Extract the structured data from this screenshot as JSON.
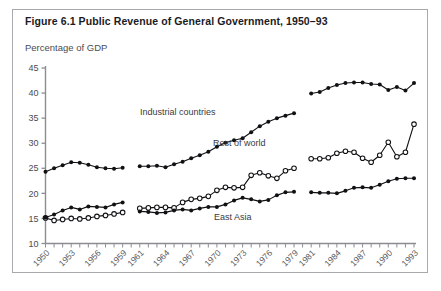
{
  "figure": {
    "title": "Figure 6.1 Public Revenue of General Government, 1950–93",
    "subtitle": "Percentage of GDP"
  },
  "annotations": {
    "industrial": "Industrial countries",
    "rest_of_world": "Rest of world",
    "east_asia": "East Asia"
  },
  "chart_data": {
    "type": "line",
    "title": "Figure 6.1 Public Revenue of General Government, 1950–93",
    "subtitle": "Percentage of GDP",
    "xlabel": "",
    "ylabel": "Percentage of GDP",
    "ylim": [
      10,
      45
    ],
    "ytick_values": [
      10,
      15,
      20,
      25,
      30,
      35,
      40,
      45
    ],
    "xlim": [
      1950,
      1993
    ],
    "xtick_labels": [
      "1950",
      "1953",
      "1956",
      "1959",
      "1961",
      "1964",
      "1967",
      "1970",
      "1973",
      "1976",
      "1979",
      "1981",
      "1984",
      "1987",
      "1990",
      "1993"
    ],
    "xtick_label_years": [
      1950,
      1953,
      1956,
      1959,
      1961,
      1964,
      1967,
      1970,
      1973,
      1976,
      1979,
      1981,
      1984,
      1987,
      1990,
      1993
    ],
    "minor_ticks_every_year": true,
    "grid": false,
    "legend_position": "inline-annotations",
    "data_gap_years": [
      1960,
      1980
    ],
    "series": [
      {
        "name": "Industrial countries",
        "marker": "filled-circle",
        "x": [
          1950,
          1951,
          1952,
          1953,
          1954,
          1955,
          1956,
          1957,
          1958,
          1959,
          1961,
          1962,
          1963,
          1964,
          1965,
          1966,
          1967,
          1968,
          1969,
          1970,
          1971,
          1972,
          1973,
          1974,
          1975,
          1976,
          1977,
          1978,
          1979,
          1981,
          1982,
          1983,
          1984,
          1985,
          1986,
          1987,
          1988,
          1989,
          1990,
          1991,
          1992,
          1993
        ],
        "values": [
          24.3,
          25.0,
          25.6,
          26.2,
          26.1,
          25.7,
          25.2,
          25.0,
          24.9,
          25.1,
          25.4,
          25.4,
          25.5,
          25.2,
          25.8,
          26.3,
          27.0,
          27.6,
          28.3,
          29.3,
          30.1,
          30.6,
          31.0,
          32.2,
          33.4,
          34.3,
          35.0,
          35.5,
          36.0,
          39.9,
          40.2,
          41.0,
          41.6,
          42.0,
          42.1,
          42.1,
          41.8,
          41.7,
          40.6,
          41.2,
          40.5,
          42.0
        ]
      },
      {
        "name": "Rest of world",
        "marker": "open-circle",
        "x": [
          1950,
          1951,
          1952,
          1953,
          1954,
          1955,
          1956,
          1957,
          1958,
          1959,
          1961,
          1962,
          1963,
          1964,
          1965,
          1966,
          1967,
          1968,
          1969,
          1970,
          1971,
          1972,
          1973,
          1974,
          1975,
          1976,
          1977,
          1978,
          1979,
          1981,
          1982,
          1983,
          1984,
          1985,
          1986,
          1987,
          1988,
          1989,
          1990,
          1991,
          1992,
          1993
        ],
        "values": [
          15.1,
          14.6,
          14.8,
          15.0,
          14.9,
          15.1,
          15.4,
          15.6,
          15.9,
          16.2,
          17.0,
          17.1,
          17.2,
          17.2,
          17.1,
          18.2,
          18.8,
          19.0,
          19.4,
          20.6,
          21.2,
          21.1,
          21.2,
          23.6,
          24.1,
          23.5,
          23.0,
          24.5,
          25.0,
          26.9,
          26.9,
          27.1,
          28.0,
          28.4,
          28.2,
          27.0,
          26.2,
          27.6,
          30.2,
          27.3,
          28.2,
          33.8
        ]
      },
      {
        "name": "East Asia",
        "marker": "filled-circle",
        "x": [
          1950,
          1951,
          1952,
          1953,
          1954,
          1955,
          1956,
          1957,
          1958,
          1959,
          1961,
          1962,
          1963,
          1964,
          1965,
          1966,
          1967,
          1968,
          1969,
          1970,
          1971,
          1972,
          1973,
          1974,
          1975,
          1976,
          1977,
          1978,
          1979,
          1981,
          1982,
          1983,
          1984,
          1985,
          1986,
          1987,
          1988,
          1989,
          1990,
          1991,
          1992,
          1993
        ],
        "values": [
          15.2,
          15.8,
          16.6,
          17.2,
          16.8,
          17.4,
          17.3,
          17.2,
          17.8,
          18.2,
          16.4,
          16.3,
          16.1,
          16.2,
          16.6,
          16.8,
          16.6,
          17.0,
          17.3,
          17.3,
          17.8,
          18.6,
          19.1,
          18.8,
          18.4,
          18.7,
          19.6,
          20.2,
          20.3,
          20.2,
          20.1,
          20.1,
          20.0,
          20.5,
          21.1,
          21.2,
          21.1,
          21.7,
          22.4,
          22.9,
          23.0,
          23.0
        ]
      }
    ]
  }
}
